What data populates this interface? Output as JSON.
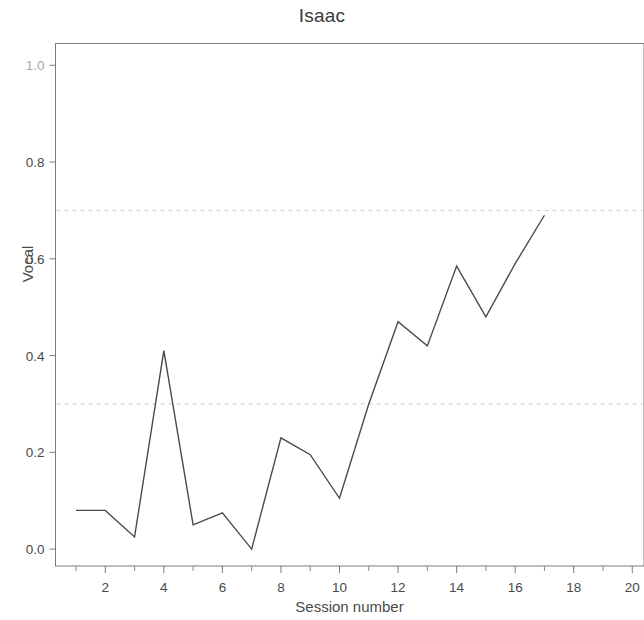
{
  "chart_data": {
    "type": "line",
    "title": "Isaac",
    "xlabel": "Session number",
    "ylabel": "Vocal",
    "x": [
      1,
      2,
      3,
      4,
      5,
      6,
      7,
      8,
      9,
      10,
      11,
      12,
      13,
      14,
      15,
      16,
      17
    ],
    "values": [
      0.08,
      0.08,
      0.025,
      0.41,
      0.05,
      0.075,
      0.0,
      0.23,
      0.195,
      0.105,
      0.3,
      0.47,
      0.42,
      0.585,
      0.48,
      0.59,
      0.69
    ],
    "series": [
      {
        "name": "Vocal",
        "values": [
          0.08,
          0.08,
          0.025,
          0.41,
          0.05,
          0.075,
          0.0,
          0.23,
          0.195,
          0.105,
          0.3,
          0.47,
          0.42,
          0.585,
          0.48,
          0.59,
          0.69
        ]
      }
    ],
    "xlim": [
      0.3,
      20.4
    ],
    "ylim": [
      -0.035,
      1.045
    ],
    "xticks": [
      2,
      4,
      6,
      8,
      10,
      12,
      14,
      16,
      18,
      20
    ],
    "xticklabels": [
      "2",
      "4",
      "6",
      "8",
      "10",
      "12",
      "14",
      "16",
      "18",
      "20"
    ],
    "xminorticks": [
      1,
      3,
      5,
      7,
      9,
      11,
      13,
      15,
      17,
      19
    ],
    "yticks": [
      0.0,
      0.2,
      0.4,
      0.6,
      0.8,
      1.0
    ],
    "yticklabels": [
      "0.0",
      "0.2",
      "0.4",
      "0.6",
      "0.8",
      "1.0"
    ],
    "grid": false,
    "legend": "none",
    "reference_lines": [
      {
        "name": "upper-criterion",
        "y": 0.7,
        "style": "dashed",
        "color": "#cccccc"
      },
      {
        "name": "lower-criterion",
        "y": 0.3,
        "style": "dashed",
        "color": "#cccccc"
      }
    ],
    "line_color": "#4a4a4a",
    "background_color": "#ffffff",
    "frame_color": "#777777"
  }
}
